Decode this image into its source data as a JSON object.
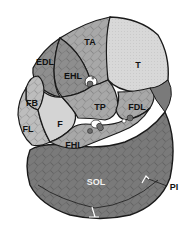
{
  "diagram": {
    "colors": {
      "outline": "#1a1a1a",
      "dark_muscle": "#7a7a7a",
      "mid_muscle": "#a8a8a8",
      "light_muscle": "#bdbdbd",
      "bone_tibia": "#d8d8d8",
      "bone_fibula": "#d4d4d4",
      "vessel": "#6e6e6e",
      "background": "#ffffff"
    },
    "labels": {
      "ta": "TA",
      "edl": "EDL",
      "ehl": "EHL",
      "t": "T",
      "fb": "FB",
      "tp": "TP",
      "fdl": "FDL",
      "fl": "FL",
      "f": "F",
      "fhl": "FHL",
      "sol": "SOL",
      "pi": "PI"
    }
  }
}
